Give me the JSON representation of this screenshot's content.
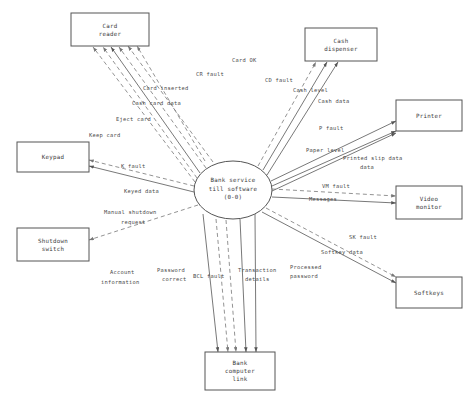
{
  "diagram": {
    "type": "data-flow-diagram",
    "colors": {
      "background": "#ffffff",
      "stroke": "#555555",
      "dashed_stroke": "#777777",
      "text": "#3a3a3a"
    }
  },
  "process": {
    "id": "bank-service-till-software",
    "line1": "Bank service",
    "line2": "till software",
    "line3": "(0-0)",
    "cx": 233,
    "cy": 190,
    "rx": 39,
    "ry": 29
  },
  "entities": [
    {
      "id": "card-reader",
      "line1": "Card",
      "line2": "reader",
      "line3": "",
      "x": 71,
      "y": 13,
      "w": 78,
      "h": 33
    },
    {
      "id": "cash-dispenser",
      "line1": "Cash",
      "line2": "dispenser",
      "line3": "",
      "x": 305,
      "y": 28,
      "w": 72,
      "h": 33
    },
    {
      "id": "printer",
      "line1": "Printer",
      "line2": "",
      "line3": "",
      "x": 396,
      "y": 100,
      "w": 66,
      "h": 31
    },
    {
      "id": "video-monitor",
      "line1": "Video",
      "line2": "monitor",
      "line3": "",
      "x": 396,
      "y": 186,
      "w": 66,
      "h": 33
    },
    {
      "id": "softkeys",
      "line1": "Softkeys",
      "line2": "",
      "line3": "",
      "x": 396,
      "y": 277,
      "w": 66,
      "h": 31
    },
    {
      "id": "keypad",
      "line1": "Keypad",
      "line2": "",
      "line3": "",
      "x": 17,
      "y": 142,
      "w": 72,
      "h": 30
    },
    {
      "id": "shutdown-switch",
      "line1": "Shutdown",
      "line2": "switch",
      "line3": "",
      "x": 17,
      "y": 228,
      "w": 72,
      "h": 33
    },
    {
      "id": "bank-computer-link",
      "line1": "Bank",
      "line2": "computer",
      "line3": "link",
      "x": 205,
      "y": 352,
      "w": 70,
      "h": 38
    }
  ],
  "flows": [
    {
      "id": "card-ok",
      "label": "Card OK",
      "style": "dashed",
      "x1": 205,
      "y1": 161,
      "x2": 137,
      "y2": 46,
      "lx": 232,
      "ly": 62,
      "anchor": "start"
    },
    {
      "id": "cr-fault",
      "label": "CR fault",
      "style": "dashed",
      "x1": 213,
      "y1": 162,
      "x2": 128,
      "y2": 46,
      "lx": 196,
      "ly": 76,
      "anchor": "start"
    },
    {
      "id": "card-inserted",
      "label": "Card inserted",
      "style": "dashed",
      "x1": 206,
      "y1": 168,
      "x2": 119,
      "y2": 47,
      "lx": 143,
      "ly": 90,
      "anchor": "start"
    },
    {
      "id": "cash-card-data",
      "label": "Cash card data",
      "style": "solid",
      "x1": 200,
      "y1": 173,
      "x2": 111,
      "y2": 47,
      "lx": 132,
      "ly": 105,
      "anchor": "start"
    },
    {
      "id": "eject-card",
      "label": "Eject card",
      "style": "dashed",
      "x1": 197,
      "y1": 178,
      "x2": 103,
      "y2": 47,
      "lx": 116,
      "ly": 121,
      "anchor": "start"
    },
    {
      "id": "keep-card",
      "label": "Keep card",
      "style": "dashed",
      "x1": 195,
      "y1": 182,
      "x2": 93,
      "y2": 47,
      "lx": 89,
      "ly": 137,
      "anchor": "start"
    },
    {
      "id": "cd-fault",
      "label": "CD fault",
      "style": "dashed",
      "x1": 258,
      "y1": 166,
      "x2": 316,
      "y2": 62,
      "lx": 265,
      "ly": 82,
      "anchor": "start"
    },
    {
      "id": "cash-level",
      "label": "Cash level",
      "style": "solid",
      "x1": 263,
      "y1": 170,
      "x2": 327,
      "y2": 62,
      "lx": 293,
      "ly": 92,
      "anchor": "start"
    },
    {
      "id": "cash-data",
      "label": "Cash data",
      "style": "solid",
      "x1": 267,
      "y1": 175,
      "x2": 338,
      "y2": 62,
      "lx": 318,
      "ly": 103,
      "anchor": "start"
    },
    {
      "id": "p-fault",
      "label": "P fault",
      "style": "solid",
      "x1": 271,
      "y1": 181,
      "x2": 396,
      "y2": 121,
      "lx": 319,
      "ly": 130,
      "anchor": "start"
    },
    {
      "id": "paper-level",
      "label": "Paper level",
      "style": "solid",
      "x1": 272,
      "y1": 186,
      "x2": 396,
      "y2": 131,
      "lx": 306,
      "ly": 152,
      "anchor": "start"
    },
    {
      "id": "printed-slip-data",
      "label": "Printed slip data",
      "style": "solid",
      "x1": 272,
      "y1": 191,
      "x2": 396,
      "y2": 133,
      "lx": 343,
      "ly": 160,
      "anchor": "start",
      "label2": "data",
      "lx2": 360,
      "ly2": 169
    },
    {
      "id": "vm-fault",
      "label": "VM fault",
      "style": "dashed",
      "x1": 272,
      "y1": 189,
      "x2": 396,
      "y2": 196,
      "lx": 322,
      "ly": 188,
      "anchor": "start"
    },
    {
      "id": "messages",
      "label": "Messages",
      "style": "solid",
      "x1": 272,
      "y1": 197,
      "x2": 396,
      "y2": 203,
      "lx": 309,
      "ly": 201,
      "anchor": "start"
    },
    {
      "id": "sk-fault",
      "label": "SK fault",
      "style": "dashed",
      "x1": 266,
      "y1": 208,
      "x2": 396,
      "y2": 277,
      "lx": 349,
      "ly": 239,
      "anchor": "start"
    },
    {
      "id": "softkey-data",
      "label": "Softkey data",
      "style": "solid",
      "x1": 262,
      "y1": 212,
      "x2": 396,
      "y2": 283,
      "lx": 321,
      "ly": 254,
      "anchor": "start"
    },
    {
      "id": "k-fault",
      "label": "K fault",
      "style": "dashed",
      "x1": 194,
      "y1": 186,
      "x2": 89,
      "y2": 160,
      "lx": 121,
      "ly": 168,
      "anchor": "start"
    },
    {
      "id": "keyed-data",
      "label": "Keyed data",
      "style": "solid",
      "x1": 194,
      "y1": 192,
      "x2": 89,
      "y2": 166,
      "lx": 124,
      "ly": 193,
      "anchor": "start"
    },
    {
      "id": "manual-shutdown",
      "label": "Manual shutdown",
      "style": "dashed",
      "x1": 198,
      "y1": 205,
      "x2": 89,
      "y2": 240,
      "lx": 104,
      "ly": 214,
      "anchor": "start",
      "label2": "request",
      "lx2": 121,
      "ly2": 224
    },
    {
      "id": "account-information",
      "label": "Account",
      "style": "solid",
      "x1": 203,
      "y1": 214,
      "x2": 218,
      "y2": 352,
      "lx": 110,
      "ly": 274,
      "anchor": "start",
      "label2": "information",
      "lx2": 101,
      "ly2": 284
    },
    {
      "id": "password-correct",
      "label": "Password",
      "style": "dashed",
      "x1": 216,
      "y1": 219,
      "x2": 228,
      "y2": 352,
      "lx": 157,
      "ly": 272,
      "anchor": "start",
      "label2": "correct",
      "lx2": 162,
      "ly2": 281
    },
    {
      "id": "bcl-fault",
      "label": "BCL fault",
      "style": "dashed",
      "x1": 226,
      "y1": 220,
      "x2": 236,
      "y2": 352,
      "lx": 193,
      "ly": 278,
      "anchor": "start"
    },
    {
      "id": "transaction-details",
      "label": "Transaction",
      "style": "solid",
      "x1": 240,
      "y1": 219,
      "x2": 246,
      "y2": 352,
      "lx": 238,
      "ly": 272,
      "anchor": "start",
      "label2": "details",
      "lx2": 245,
      "ly2": 281
    },
    {
      "id": "processed-password",
      "label": "Processed",
      "style": "solid",
      "x1": 255,
      "y1": 214,
      "x2": 256,
      "y2": 352,
      "lx": 290,
      "ly": 269,
      "anchor": "start",
      "label2": "password",
      "lx2": 290,
      "ly2": 278
    }
  ]
}
